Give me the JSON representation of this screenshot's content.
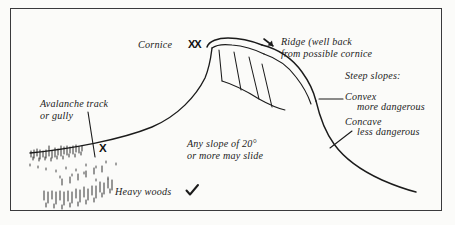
{
  "figure": {
    "kind": "line-drawing-diagram",
    "border_color": "#3a3a3c",
    "ink_color": "#1b1b1b",
    "background_color": "#fbfbf9"
  },
  "labels": {
    "cornice": "Cornice",
    "cornice_marks": "XX",
    "ridge_line1": "Ridge (well back",
    "ridge_line2": "from possible cornice",
    "ridge_marker": "down-right-arrow",
    "steep_slopes": "Steep slopes:",
    "convex": "Convex",
    "convex_note": "more dangerous",
    "concave": "Concave",
    "concave_note": "less dangerous",
    "track_line1": "Avalanche track",
    "track_line2": "or gully",
    "track_mark": "X",
    "slope_line1": "Any slope of 20°",
    "slope_line2": "or more may slide",
    "heavy_woods": "Heavy woods",
    "heavy_woods_mark": "check"
  }
}
